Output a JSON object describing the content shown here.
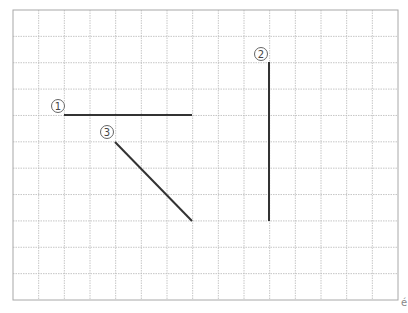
{
  "diagram": {
    "type": "grid-line-segments",
    "grid": {
      "left": 13,
      "top": 10,
      "right": 398,
      "bottom": 300,
      "columns": 15,
      "rows": 11,
      "line_color": "#b8b8b8",
      "border_color": "#a8a8a8"
    },
    "segment_color": "#333333",
    "segments": [
      {
        "id": "1",
        "label": "①",
        "x1": 64,
        "y1": 115,
        "x2": 192,
        "y2": 115,
        "label_x": 58,
        "label_y": 106,
        "orientation": "horizontal"
      },
      {
        "id": "2",
        "label": "②",
        "x1": 269,
        "y1": 62,
        "x2": 269,
        "y2": 221,
        "label_x": 261,
        "label_y": 54,
        "orientation": "vertical"
      },
      {
        "id": "3",
        "label": "③",
        "x1": 115,
        "y1": 142,
        "x2": 192,
        "y2": 221,
        "label_x": 107,
        "label_y": 132,
        "orientation": "diagonal"
      }
    ]
  },
  "corner_glyph": "é"
}
